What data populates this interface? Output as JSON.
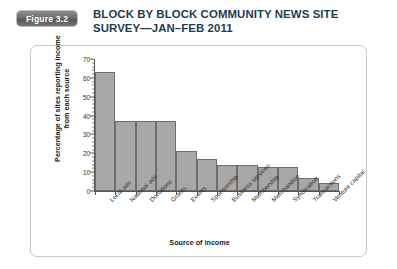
{
  "figure": {
    "badge_label": "Figure 3.2",
    "title_line1": "BLOCK BY BLOCK COMMUNITY NEWS SITE",
    "title_line2": "SURVEY—JAN–FEB 2011",
    "title_color": "#1d3c52",
    "badge_color": "#6f6f6f"
  },
  "chart_data": {
    "type": "bar",
    "title": "BLOCK BY BLOCK COMMUNITY NEWS SITE SURVEY—JAN–FEB 2011",
    "xlabel": "Source of income",
    "ylabel_line1": "Percentage of sites reporting income",
    "ylabel_line2": "from each source",
    "ylabel": "Percentage of sites reporting income from each source",
    "categories": [
      "Local ads",
      "National ads",
      "Donations",
      "Grants",
      "Events",
      "Sponsorship",
      "Business services",
      "Membership",
      "Merchandise",
      "Syndication",
      "Transactions",
      "Venture capital"
    ],
    "values": [
      63,
      37,
      37,
      37,
      21,
      17,
      14,
      14,
      13,
      13,
      7,
      4
    ],
    "ylim": [
      0,
      70
    ],
    "yticks": [
      0,
      10,
      20,
      30,
      40,
      50,
      60,
      70
    ],
    "ytick_labels": [
      "0",
      "10",
      "20",
      "30",
      "40",
      "50",
      "60",
      "70"
    ],
    "grid": false,
    "legend": false,
    "bar_color": "#a8a8a8",
    "bar_edge_color": "#6d6d6d"
  }
}
